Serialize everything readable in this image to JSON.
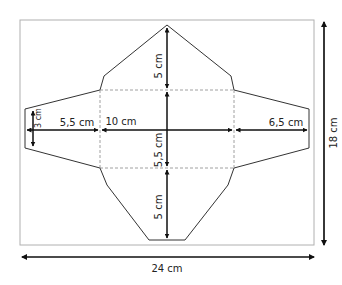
{
  "diagram": {
    "type": "envelope net template",
    "labels": {
      "top_flap_height": "5 cm",
      "bottom_flap_height": "5 cm",
      "center_height": "5,5 cm",
      "center_width": "10 cm",
      "left_flap_width": "5,5 cm",
      "right_flap_width": "6,5 cm",
      "left_flap_edge_height": "3 cm",
      "total_width": "24 cm",
      "total_height": "18 cm"
    },
    "colors": {
      "line": "#333333",
      "frame": "#aaaaaa",
      "dashed": "#888888"
    }
  }
}
